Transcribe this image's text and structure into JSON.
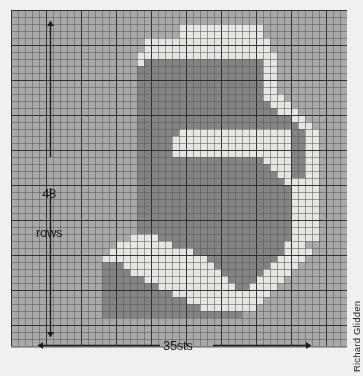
{
  "figure": {
    "kind": "knitting-intarsia-chart",
    "credit": "Richard Glidden",
    "row_label_line1": "48",
    "row_label_line2": "rows",
    "stitch_label": "35sts",
    "colors": {
      "page_background": "#f2f0ee",
      "grid_background": "#a9a9a7",
      "shade_light": "#e7e6e2",
      "shade_mid": "#a9a9a7",
      "shade_dark": "#848483",
      "grid_line": "#5a5a58",
      "grid_line_major": "#2b2b2a",
      "annotation": "#1b1b1b"
    }
  },
  "chart_data": {
    "type": "heatmap",
    "title": "",
    "subtitle": "",
    "xlabel": "35sts",
    "ylabel": "48 rows",
    "grid": true,
    "legend_position": "none",
    "cols": 48,
    "rows": 48,
    "cell_px": 7,
    "major_every": 5,
    "palette": {
      "0": "#a9a9a7",
      "1": "#848483",
      "2": "#e7e6e2"
    },
    "x": [
      1,
      2,
      3,
      4,
      5,
      6,
      7,
      8,
      9,
      10,
      11,
      12,
      13,
      14,
      15,
      16,
      17,
      18,
      19,
      20,
      21,
      22,
      23,
      24,
      25,
      26,
      27,
      28,
      29,
      30,
      31,
      32,
      33,
      34,
      35,
      36,
      37,
      38,
      39,
      40,
      41,
      42,
      43,
      44,
      45,
      46,
      47,
      48
    ],
    "values": [
      "000000000000000000000000000000000000000000000000",
      "000000000000000000000000000000000000000000000000",
      "000000000000000000000000222222222222000000000000",
      "000000000000000000000000222222222222000000000000",
      "000000000000000000022222222222222222200000000000",
      "000000000000000000022222222222222222200000000000",
      "000000000000000000222222222222222222220000000000",
      "000000000000000000211111111111111111220000000000",
      "000000000000000000111111111111111111220000000000",
      "000000000000000000111111111111111111220000000000",
      "000000000000000000111111111111111111220000000000",
      "000000000000000000111111111111111111220000000000",
      "000000000000000000111111111111111111222000000000",
      "000000000000000000111111111111111111122200000000",
      "000000000000000000111111111111111111112220000000",
      "000000000000000000111111111111111111111122000000",
      "000000000000000000111111111111111111111112200000",
      "000000000000000000111111222222222222222211220000",
      "000000000000000000111112222222222222222211220000",
      "000000000000000000111112222222222222222211220000",
      "000000000000000000111112222222222222222211220000",
      "000000000000000000111111111111111111222211220000",
      "000000000000000000111111111111111111122211220000",
      "000000000000000000111111111111111111112211220000",
      "000000000000000000111111111111111111111222220000",
      "000000000000000000111111111111111111111122220000",
      "000000000000000000111111111111111111111122220000",
      "000000000000000000111111111111111111111122220000",
      "000000000000000000111111111111111111111122220000",
      "000000000000000000111111111111111111111122220000",
      "000000000000000000111111111111111111111122220000",
      "000000000000000000111111111111111111111122220000",
      "000000000000000002222111111111111111111122220000",
      "000000000000000222222221111111111111111222 0000",
      "000000000000002222222222221111111111111222200000",
      "000000000000022222222222222211111111112222000000",
      "000000000000011122222222222221111111122220000000",
      "000000000000011112222222222222111111222200000000",
      "000000000000011111122222222222211112222000000000",
      "000000000000011111111222222222221122220000000000",
      "000000000000011111111112222222222222200000000000",
      "000000000000011111111111122222222222000000000000",
      "000000000000011111111111111222222220000000000000",
      "000000000000011111111111111111111000000000000000",
      "000000000000000000000000000000000000000000000000",
      "000000000000000000000000000000000000000000000000",
      "000000000000000000000000000000000000000000000000",
      "000000000000000000000000000000000000000000000000"
    ]
  },
  "annotations": {
    "vertical_arrow": {
      "name": "rows-dimension-arrow",
      "from_row": 1,
      "to_row": 48,
      "label": "48 rows"
    },
    "horizontal_arrow": {
      "name": "stitches-dimension-arrow",
      "from_col": 4,
      "to_col": 44,
      "label": "35sts"
    }
  }
}
